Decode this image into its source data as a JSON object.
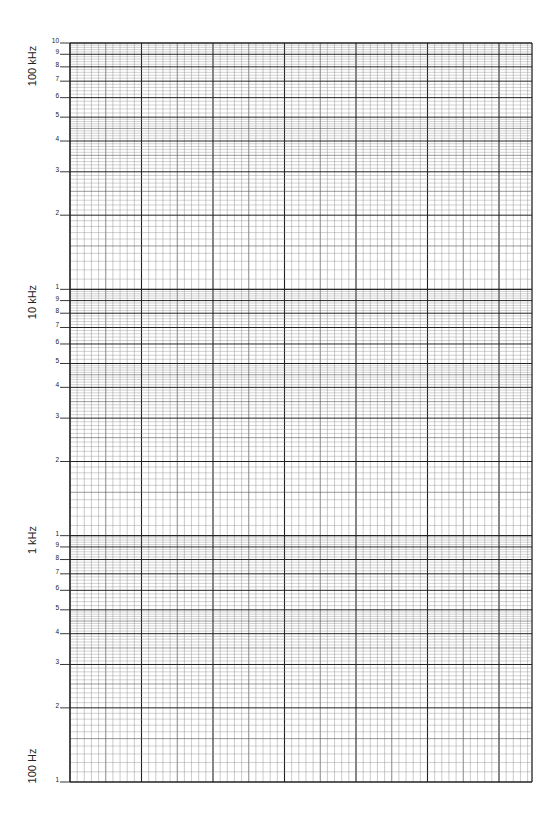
{
  "chart_data": {
    "type": "semilog-graph-paper",
    "title": "",
    "xlabel": "",
    "ylabel": "Frequency",
    "yscale": "log",
    "ylim": [
      100,
      100000
    ],
    "decades": 3,
    "decade_labels": [
      {
        "text": "100 kHz",
        "center_y": 66
      },
      {
        "text": "10 kHz",
        "center_y": 302
      },
      {
        "text": "1 kHz",
        "center_y": 540
      },
      {
        "text": "100 Hz",
        "center_y": 766
      }
    ],
    "decade_tick_labels": [
      "1",
      "2",
      "3",
      "4",
      "5",
      "6",
      "7",
      "8",
      "9"
    ],
    "top_tick_label": "10",
    "x_major_divisions": 6.5,
    "x_minor_per_major": 10,
    "grid": true,
    "series": []
  },
  "grid": {
    "left": 70,
    "right": 532,
    "top": 43,
    "bottom": 782,
    "major_x_spacing": 71.5,
    "line_color": "#222222",
    "minor_color": "#8a8a8a"
  }
}
